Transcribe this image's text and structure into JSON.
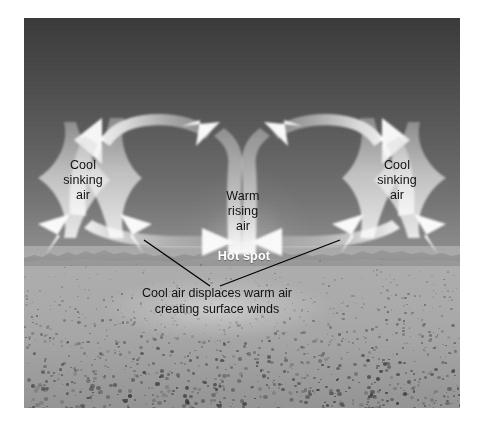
{
  "figure": {
    "type": "convection-cell-diagram",
    "labels": {
      "cool_left": "Cool\nsinking\nair",
      "cool_right": "Cool\nsinking\nair",
      "warm_center": "Warm\nrising\nair",
      "hot_spot": "Hot spot",
      "caption": "Cool air displaces warm air\ncreating surface winds"
    },
    "colors": {
      "sky_top": "#3a3a3a",
      "sky_horizon": "#8e8e8e",
      "ground": "#a8a8a8",
      "arrow": "#f2f2f2",
      "label_text": "#111111",
      "hotspot_text": "#ffffff",
      "leader_line": "#000000",
      "page_background": "#ffffff"
    },
    "elements": {
      "convection_cells": 2,
      "rising_column": "center",
      "sinking_columns": "left and right edges",
      "leader_lines": 2,
      "arrow_direction_left_cell": "counterclockwise",
      "arrow_direction_right_cell": "clockwise"
    }
  }
}
